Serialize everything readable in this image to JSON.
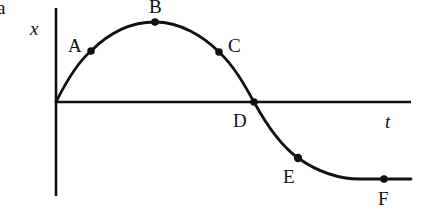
{
  "figure": {
    "panel_label": "a",
    "y_axis_label": "x",
    "x_axis_label": "t",
    "points": [
      {
        "label": "A",
        "x": 91,
        "y": 51
      },
      {
        "label": "B",
        "x": 155,
        "y": 22
      },
      {
        "label": "C",
        "x": 219,
        "y": 52
      },
      {
        "label": "D",
        "x": 254,
        "y": 102
      },
      {
        "label": "E",
        "x": 298,
        "y": 158
      },
      {
        "label": "F",
        "x": 384,
        "y": 179
      }
    ],
    "colors": {
      "ink": "#111111",
      "background": "#ffffff"
    }
  }
}
